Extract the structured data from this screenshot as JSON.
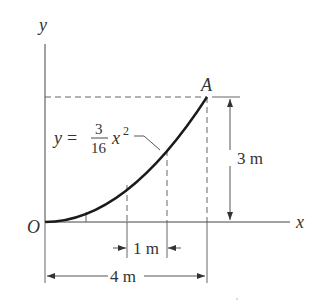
{
  "figure": {
    "axes": {
      "x_label": "x",
      "y_label": "y",
      "origin_label": "O"
    },
    "point": {
      "label": "A",
      "x_m": 4,
      "y_m": 3
    },
    "curve": {
      "equation_lhs": "y =",
      "coef_numerator": "3",
      "coef_denominator": "16",
      "variable": "x",
      "exponent": "2"
    },
    "dimensions": {
      "height": "3 m",
      "segment": "1 m",
      "width": "4 m"
    },
    "colors": {
      "ink": "#333333",
      "curve": "#1a1a1a",
      "background": "#ffffff"
    }
  }
}
